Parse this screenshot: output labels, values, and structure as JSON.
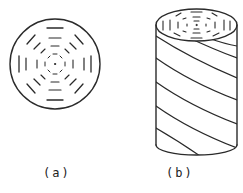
{
  "figure": {
    "panels": [
      {
        "id": "a",
        "label": "(a)",
        "description": "cross-section disk with concentric dashed octagonal rings"
      },
      {
        "id": "b",
        "label": "(b)",
        "description": "cylinder with concentric dashed rings on top face and helical diagonal stripes on side"
      }
    ],
    "stroke_color": "#2a2a2a",
    "background": "#ffffff"
  }
}
